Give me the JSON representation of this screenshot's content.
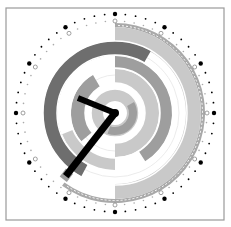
{
  "clock": {
    "type": "polar-clock",
    "center": [
      115,
      113
    ],
    "frame": {
      "x": 6,
      "y": 8,
      "w": 218,
      "h": 212,
      "stroke": "#9a9a9a"
    },
    "colors": {
      "dark": "#6e6e6e",
      "medium": "#9e9e9e",
      "light": "#c9c9c9",
      "outer_ring": "#a9a9a9",
      "hands": "#000000",
      "dots": "#000000"
    },
    "hands": {
      "hour_angle_deg": 292,
      "hour_length": 40,
      "minute_angle_deg": 218,
      "minute_length": 80
    },
    "rings": [
      {
        "name": "outer-thin-ring",
        "r_in": 86,
        "r_out": 90,
        "start": 0,
        "end": 216,
        "color": "outer_ring"
      },
      {
        "name": "light-band-ring",
        "r_in": 71,
        "r_out": 86,
        "start": 0,
        "end": 180,
        "color": "light"
      },
      {
        "name": "dark-ring",
        "r_in": 58,
        "r_out": 72,
        "start": 208,
        "end": 360,
        "color": "dark"
      },
      {
        "name": "dark-ring-right",
        "r_in": 58,
        "r_out": 72,
        "start": 0,
        "end": 30,
        "color": "dark"
      },
      {
        "name": "medium-ring",
        "r_in": 45,
        "r_out": 57,
        "start": 0,
        "end": 148,
        "color": "medium"
      },
      {
        "name": "light-ring-left",
        "r_in": 45,
        "r_out": 57,
        "start": 180,
        "end": 248,
        "color": "light"
      },
      {
        "name": "light-inner-right",
        "r_in": 30,
        "r_out": 44,
        "start": 0,
        "end": 180,
        "color": "light"
      },
      {
        "name": "medium-inner-left",
        "r_in": 30,
        "r_out": 44,
        "start": 230,
        "end": 330,
        "color": "medium"
      },
      {
        "name": "light-core",
        "r_in": 12,
        "r_out": 24,
        "start": 0,
        "end": 360,
        "color": "light"
      },
      {
        "name": "medium-core",
        "r_in": 14,
        "r_out": 22,
        "start": 60,
        "end": 200,
        "color": "medium"
      }
    ],
    "outer_dots_radius": 99,
    "inner_dots_radius": 92
  }
}
